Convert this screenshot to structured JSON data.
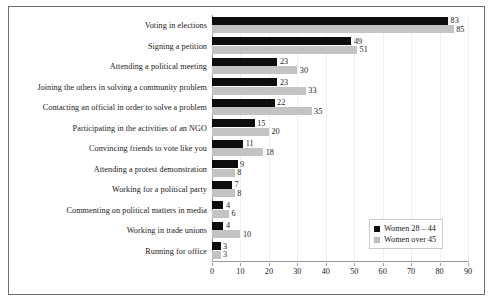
{
  "chart_data": {
    "type": "bar",
    "orientation": "horizontal",
    "grouped": true,
    "title": "",
    "subtitle": "",
    "xlabel": "",
    "ylabel": "",
    "xlim": [
      0,
      90
    ],
    "xticks": [
      0,
      10,
      20,
      30,
      40,
      50,
      60,
      70,
      80,
      90
    ],
    "xtick_labels": [
      "0",
      "10",
      "20",
      "30",
      "40",
      "50",
      "60",
      "70",
      "80",
      "90"
    ],
    "grid": "vertical-light",
    "legend_position": "inside-bottom-right",
    "show_data_labels": true,
    "categories": [
      "Voting in elections",
      "Signing a petition",
      "Attending a political meeting",
      "Joining the others in solving a community problem",
      "Contacting an official in order to solve a problem",
      "Participating in the activities of an NGO",
      "Convincing friends to vote like you",
      "Attending a protest demonstration",
      "Working for a political party",
      "Commenting on political matters in media",
      "Working in trade unions",
      "Running for office"
    ],
    "series": [
      {
        "name": "Women 28 – 44",
        "color": "#0d0d0d",
        "values": [
          83,
          49,
          23,
          23,
          22,
          15,
          11,
          9,
          7,
          4,
          4,
          3
        ]
      },
      {
        "name": "Women over 45",
        "color": "#c3c3c3",
        "values": [
          85,
          51,
          30,
          33,
          35,
          20,
          18,
          8,
          8,
          6,
          10,
          3
        ]
      }
    ]
  },
  "legend": {
    "items": [
      {
        "label": "Women 28 – 44",
        "series": 0
      },
      {
        "label": "Women over 45",
        "series": 1
      }
    ]
  }
}
